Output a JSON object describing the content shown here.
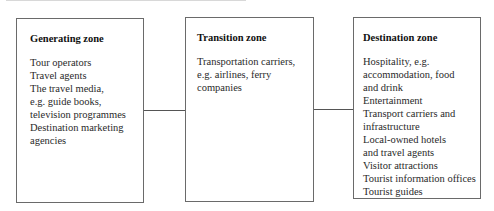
{
  "diagram": {
    "zones": [
      {
        "title": "Generating zone",
        "items": [
          "Tour operators",
          "Travel agents",
          "The travel media,\ne.g. guide books,\ntelevision programmes",
          "Destination marketing\nagencies"
        ]
      },
      {
        "title": "Transition zone",
        "items": [
          "Transportation carriers,\ne.g. airlines, ferry\ncompanies"
        ]
      },
      {
        "title": "Destination zone",
        "items": [
          "Hospitality, e.g.\naccommodation, food\nand drink",
          "Entertainment",
          "Transport carriers and\ninfrastructure",
          "Local-owned hotels\nand travel agents",
          "Visitor attractions",
          "Tourist information offices",
          "Tourist guides"
        ]
      }
    ],
    "connections": [
      {
        "from": "Generating zone",
        "to": "Transition zone"
      },
      {
        "from": "Transition zone",
        "to": "Destination zone"
      }
    ],
    "colors": {
      "border": "#6a6a6a",
      "connector": "#555555",
      "text": "#2a2a2a"
    }
  }
}
